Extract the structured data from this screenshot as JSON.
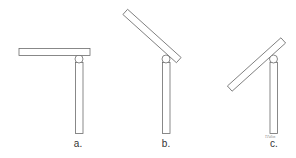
{
  "figure": {
    "stroke_color": "#6b6b6b",
    "fill_color": "#ffffff",
    "panels": [
      {
        "id": "a",
        "label": "a.",
        "beam_angle_deg": 0
      },
      {
        "id": "b",
        "label": "b.",
        "beam_angle_deg": 42
      },
      {
        "id": "c",
        "label": "c.",
        "beam_angle_deg": -42
      }
    ],
    "signature": "T.Fallon"
  }
}
